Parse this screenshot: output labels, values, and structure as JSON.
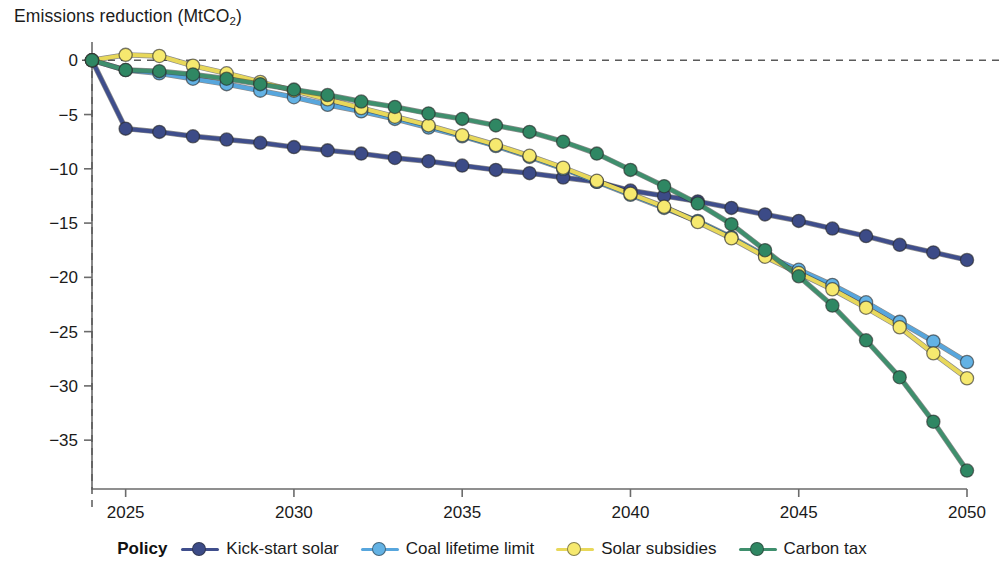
{
  "chart_data": {
    "type": "line",
    "title": "Emissions reduction (MtCO2)",
    "title_main": "Emissions reduction (MtCO",
    "title_sub": "2",
    "title_tail": ")",
    "xlabel": "",
    "ylabel": "Emissions reduction (MtCO2)",
    "xlim": [
      2024,
      2050
    ],
    "ylim": [
      -39.5,
      1.5
    ],
    "grid": false,
    "legend_position": "bottom",
    "legend_title": "Policy",
    "x_ticks": [
      2025,
      2030,
      2035,
      2040,
      2045,
      2050
    ],
    "x_tick_labels": [
      "2025",
      "2030",
      "2035",
      "2040",
      "2045",
      "2050"
    ],
    "y_ticks": [
      0,
      -5,
      -10,
      -15,
      -20,
      -25,
      -30,
      -35
    ],
    "y_tick_labels": [
      "0",
      "−5",
      "−10",
      "−15",
      "−20",
      "−25",
      "−30",
      "−35"
    ],
    "reference_lines": [
      {
        "kind": "horizontal",
        "value": 0,
        "style": "dashed"
      },
      {
        "kind": "vertical",
        "value": 2024,
        "style": "dashed"
      }
    ],
    "x": [
      2024,
      2025,
      2026,
      2027,
      2028,
      2029,
      2030,
      2031,
      2032,
      2033,
      2034,
      2035,
      2036,
      2037,
      2038,
      2039,
      2040,
      2041,
      2042,
      2043,
      2044,
      2045,
      2046,
      2047,
      2048,
      2049,
      2050
    ],
    "series": [
      {
        "name": "Kick-start solar",
        "color": "#3f4e8c",
        "marker_color": "#3c4b87",
        "values": [
          0,
          -6.3,
          -6.6,
          -7.0,
          -7.3,
          -7.6,
          -8.0,
          -8.3,
          -8.6,
          -9.0,
          -9.3,
          -9.7,
          -10.1,
          -10.4,
          -10.8,
          -11.2,
          -12.0,
          -12.5,
          -13.0,
          -13.6,
          -14.2,
          -14.8,
          -15.5,
          -16.2,
          -17.0,
          -17.7,
          -18.4
        ]
      },
      {
        "name": "Coal lifetime limit",
        "color": "#57a6dd",
        "marker_color": "#63b2e4",
        "values": [
          0,
          -0.9,
          -1.2,
          -1.7,
          -2.2,
          -2.8,
          -3.4,
          -4.1,
          -4.7,
          -5.4,
          -6.2,
          -7.0,
          -7.9,
          -8.9,
          -10.0,
          -11.2,
          -12.4,
          -13.6,
          -14.8,
          -16.3,
          -18.0,
          -19.3,
          -20.7,
          -22.3,
          -24.1,
          -25.9,
          -27.8
        ]
      },
      {
        "name": "Solar subsidies",
        "color": "#e8d85a",
        "marker_color": "#f6e96f",
        "values": [
          0,
          0.5,
          0.4,
          -0.5,
          -1.2,
          -2.0,
          -2.8,
          -3.6,
          -4.4,
          -5.2,
          -6.0,
          -6.9,
          -7.8,
          -8.8,
          -9.9,
          -11.1,
          -12.3,
          -13.5,
          -14.9,
          -16.4,
          -18.1,
          -19.6,
          -21.1,
          -22.8,
          -24.6,
          -27.0,
          -29.3
        ]
      },
      {
        "name": "Carbon tax",
        "color": "#3f8f6d",
        "marker_color": "#2f8763",
        "values": [
          0,
          -0.9,
          -1.0,
          -1.3,
          -1.7,
          -2.2,
          -2.7,
          -3.2,
          -3.8,
          -4.3,
          -4.9,
          -5.4,
          -6.0,
          -6.6,
          -7.5,
          -8.6,
          -10.1,
          -11.6,
          -13.2,
          -15.1,
          -17.5,
          -19.9,
          -22.6,
          -25.8,
          -29.2,
          -33.3,
          -37.8
        ]
      }
    ]
  },
  "legend": {
    "title": "Policy",
    "items": [
      {
        "label": "Kick-start solar",
        "color": "#3f4e8c",
        "marker_color": "#3c4b87"
      },
      {
        "label": "Coal lifetime limit",
        "color": "#57a6dd",
        "marker_color": "#63b2e4"
      },
      {
        "label": "Solar subsidies",
        "color": "#e8d85a",
        "marker_color": "#f6e96f"
      },
      {
        "label": "Carbon tax",
        "color": "#3f8f6d",
        "marker_color": "#2f8763"
      }
    ]
  }
}
